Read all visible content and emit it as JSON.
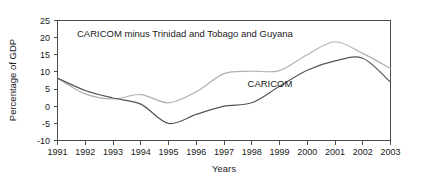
{
  "chart_data": {
    "type": "line",
    "title": "",
    "xlabel": "Years",
    "ylabel": "Percentage of GDP",
    "x": [
      1991,
      1992,
      1993,
      1994,
      1995,
      1996,
      1997,
      1998,
      1999,
      2000,
      2001,
      2002,
      2003
    ],
    "xlim": [
      1991,
      2003
    ],
    "ylim": [
      -10,
      25
    ],
    "yticks": [
      -10,
      -5,
      0,
      5,
      10,
      15,
      20,
      25
    ],
    "ytick_labels": [
      "-10",
      "-5",
      "0",
      "5",
      "10",
      "15",
      "20",
      "25"
    ],
    "xtick_labels": [
      "1991",
      "1992",
      "1993",
      "1994",
      "1995",
      "1996",
      "1997",
      "1998",
      "1999",
      "2000",
      "2001",
      "2002",
      "2003"
    ],
    "grid": false,
    "legend_position": "inline-annotation",
    "series": [
      {
        "name": "CARICOM minus Trinidad and Tobago and Guyana",
        "color": "#b0b0b0",
        "values": [
          8.2,
          3.6,
          2.1,
          3.4,
          1.0,
          4.2,
          9.5,
          10.2,
          10.4,
          15.0,
          18.8,
          15.4,
          11.0
        ]
      },
      {
        "name": "CARICOM",
        "color": "#555555",
        "values": [
          8.2,
          4.6,
          2.4,
          0.6,
          -5.0,
          -2.4,
          0.0,
          1.0,
          5.8,
          10.5,
          13.2,
          14.0,
          7.0
        ]
      }
    ],
    "annotations": [
      {
        "text": "CARICOM minus Trinidad and Tobago and Guyana",
        "x": 1992.0,
        "y": 19.0,
        "series": "CARICOM minus Trinidad and Tobago and Guyana"
      },
      {
        "text": "CARICOM",
        "x": 1999.3,
        "y": 4.5,
        "series": "CARICOM"
      }
    ]
  },
  "axes": {
    "y_axis_title": "Percentage of GDP",
    "x_axis_title": "Years"
  },
  "colors": {
    "series_light": "#b0b0b0",
    "series_dark": "#555555",
    "axis": "#4d4d4d",
    "text": "#1a1a1a",
    "background": "#ffffff"
  }
}
